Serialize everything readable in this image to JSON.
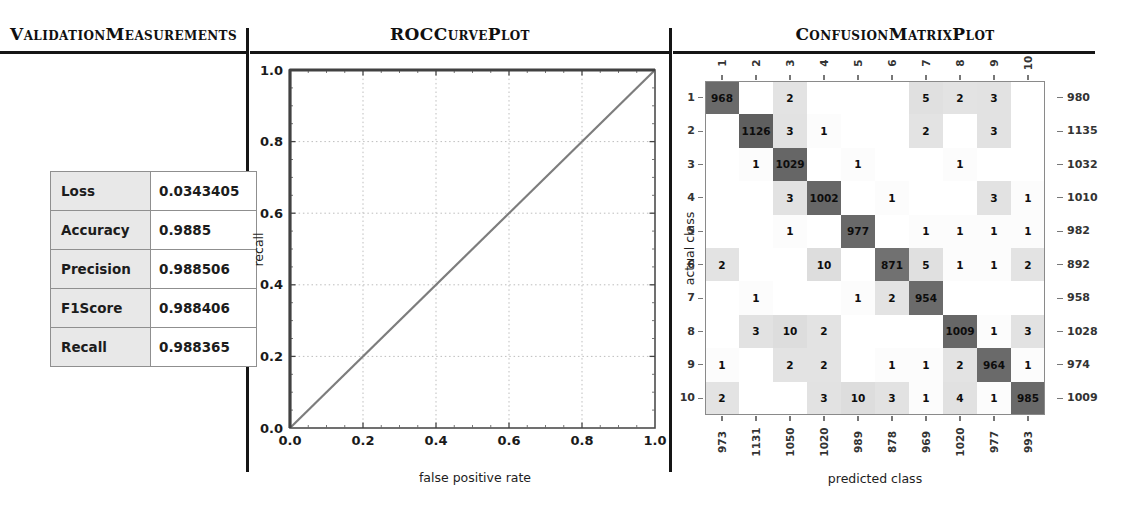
{
  "panels": {
    "validation": {
      "title": "ValidationMeasurements",
      "metrics": [
        {
          "label": "Loss",
          "value": "0.0343405"
        },
        {
          "label": "Accuracy",
          "value": "0.9885"
        },
        {
          "label": "Precision",
          "value": "0.988506"
        },
        {
          "label": "F1Score",
          "value": "0.988406"
        },
        {
          "label": "Recall",
          "value": "0.988365"
        }
      ]
    },
    "roc": {
      "title": "ROCCurvePlot"
    },
    "confusion": {
      "title": "ConfusionMatrixPlot"
    }
  },
  "chart_data": [
    {
      "type": "line",
      "title": "ROCCurvePlot",
      "xlabel": "false positive rate",
      "ylabel": "recall",
      "xlim": [
        0,
        1
      ],
      "ylim": [
        0,
        1
      ],
      "xticks": [
        0.0,
        0.2,
        0.4,
        0.6,
        0.8,
        1.0
      ],
      "yticks": [
        0.0,
        0.2,
        0.4,
        0.6,
        0.8,
        1.0
      ],
      "grid": true,
      "series": [
        {
          "name": "roc-curve",
          "x": [
            0,
            0,
            1
          ],
          "y": [
            0,
            1,
            1
          ]
        },
        {
          "name": "diagonal-reference",
          "x": [
            0,
            1
          ],
          "y": [
            0,
            1
          ]
        }
      ]
    },
    {
      "type": "heatmap",
      "title": "ConfusionMatrixPlot",
      "xlabel": "predicted class",
      "ylabel": "actual class",
      "col_labels": [
        "1",
        "2",
        "3",
        "4",
        "5",
        "6",
        "7",
        "8",
        "9",
        "10"
      ],
      "row_labels": [
        "1",
        "2",
        "3",
        "4",
        "5",
        "6",
        "7",
        "8",
        "9",
        "10"
      ],
      "matrix": [
        [
          968,
          0,
          2,
          0,
          0,
          0,
          5,
          2,
          3,
          0
        ],
        [
          0,
          1126,
          3,
          1,
          0,
          0,
          2,
          0,
          3,
          0
        ],
        [
          0,
          1,
          1029,
          0,
          1,
          0,
          0,
          1,
          0,
          0
        ],
        [
          0,
          0,
          3,
          1002,
          0,
          1,
          0,
          0,
          3,
          1
        ],
        [
          0,
          0,
          1,
          0,
          977,
          0,
          1,
          1,
          1,
          1
        ],
        [
          2,
          0,
          0,
          10,
          0,
          871,
          5,
          1,
          1,
          2
        ],
        [
          0,
          1,
          0,
          0,
          1,
          2,
          954,
          0,
          0,
          0
        ],
        [
          0,
          3,
          10,
          2,
          0,
          0,
          0,
          1009,
          1,
          3
        ],
        [
          1,
          0,
          2,
          2,
          0,
          1,
          1,
          2,
          964,
          1
        ],
        [
          2,
          0,
          0,
          3,
          10,
          3,
          1,
          4,
          1,
          985
        ]
      ],
      "row_totals": [
        980,
        1135,
        1032,
        1010,
        982,
        892,
        958,
        1028,
        974,
        1009
      ],
      "col_totals": [
        973,
        1131,
        1050,
        1020,
        989,
        878,
        969,
        1020,
        977,
        993
      ],
      "max_value": 1126
    }
  ],
  "colors": {
    "rule": "#151515",
    "table_label_bg": "#e8e8e8",
    "table_border": "#8f8f8f",
    "frame": "#4d4d4d",
    "grid": "#bdbdbd",
    "curve": "#414141",
    "diagonal_ref": "#7d7d7d",
    "matrix_frame": "#8a8a8a",
    "diag_max": "#5f5f5f",
    "tick": "#777777"
  }
}
